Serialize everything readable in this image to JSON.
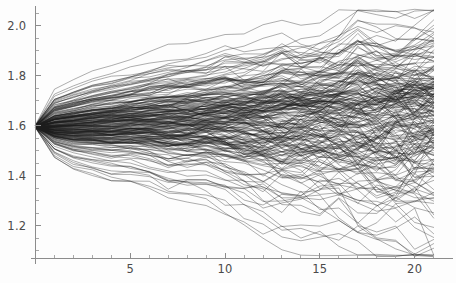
{
  "figure": {
    "title": "",
    "background_color": "#fdfdfd",
    "line_color": "#1c1c1c",
    "axis_color": "#8c8c8c",
    "label_color": "#4a4a4a"
  },
  "chart_data": {
    "type": "line",
    "title": "",
    "subtitle": "",
    "xlabel": "",
    "ylabel": "",
    "grid": false,
    "legend": null,
    "legend_position": "none",
    "n_series": 220,
    "x": [
      0,
      1,
      2,
      3,
      4,
      5,
      6,
      7,
      8,
      9,
      10,
      11,
      12,
      13,
      14,
      15,
      16,
      17,
      18,
      19,
      20,
      21
    ],
    "xlim": [
      0,
      21.6
    ],
    "ylim": [
      1.07,
      2.07
    ],
    "xticks_major": [
      5,
      10,
      15,
      20
    ],
    "xticks_major_labels": [
      "5",
      "10",
      "15",
      "20"
    ],
    "xticks_minor": [
      1,
      2,
      3,
      4,
      6,
      7,
      8,
      9,
      11,
      12,
      13,
      14,
      16,
      17,
      18,
      19,
      21
    ],
    "yticks_major": [
      1.2,
      1.4,
      1.6,
      1.8,
      2.0
    ],
    "yticks_major_labels": [
      "1.2",
      "1.4",
      "1.6",
      "1.8",
      "2.0"
    ],
    "yticks_minor": [
      1.1,
      1.15,
      1.25,
      1.3,
      1.35,
      1.45,
      1.5,
      1.55,
      1.65,
      1.7,
      1.75,
      1.85,
      1.9,
      1.95,
      2.05
    ],
    "start_value": 1.595,
    "envelope_upper": [
      1.7,
      1.72,
      1.75,
      1.78,
      1.8,
      1.82,
      1.84,
      1.86,
      1.87,
      1.88,
      1.9,
      1.9,
      1.92,
      1.95,
      1.94,
      1.96,
      1.98,
      2.05,
      2.0,
      2.0,
      2.03,
      2.04
    ],
    "envelope_lower": [
      1.54,
      1.49,
      1.45,
      1.43,
      1.41,
      1.41,
      1.39,
      1.35,
      1.34,
      1.34,
      1.31,
      1.28,
      1.25,
      1.22,
      1.21,
      1.2,
      1.19,
      1.18,
      1.16,
      1.13,
      1.09,
      1.08
    ],
    "envelope_mean": [
      1.595,
      1.6,
      1.605,
      1.61,
      1.615,
      1.62,
      1.625,
      1.628,
      1.632,
      1.636,
      1.64,
      1.643,
      1.646,
      1.65,
      1.653,
      1.656,
      1.66,
      1.663,
      1.666,
      1.67,
      1.673,
      1.676
    ]
  },
  "axes": {
    "x_axis_name": "time-axis",
    "y_axis_name": "value-axis"
  }
}
